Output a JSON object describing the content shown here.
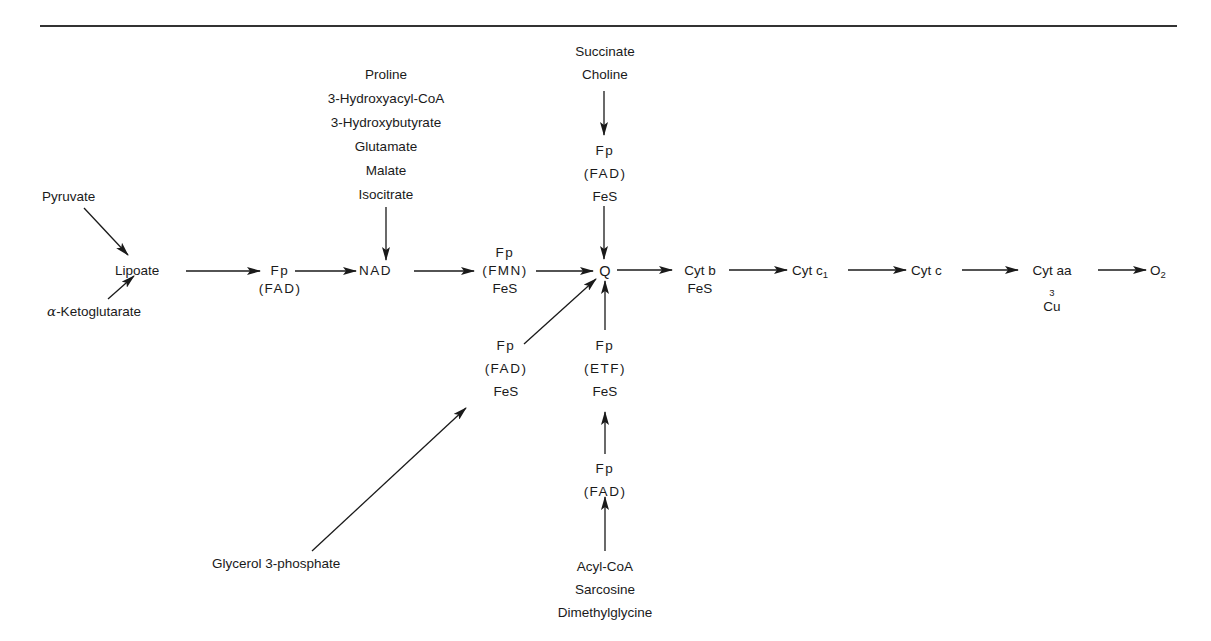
{
  "diagram": {
    "type": "electron-transport-chain",
    "colors": {
      "ink": "#1a1a1a",
      "background": "#ffffff",
      "rule": "#333333"
    },
    "main_chain": [
      {
        "id": "lipoate",
        "lines": [
          "Lipoate"
        ]
      },
      {
        "id": "fp_fad_1",
        "lines": [
          "Fp",
          "(FAD)"
        ]
      },
      {
        "id": "nad",
        "lines": [
          "NAD"
        ]
      },
      {
        "id": "fp_fmn",
        "lines": [
          "Fp",
          "(FMN)",
          "FeS"
        ]
      },
      {
        "id": "q",
        "lines": [
          "Q"
        ]
      },
      {
        "id": "cyt_b",
        "lines": [
          "Cyt b",
          "FeS"
        ]
      },
      {
        "id": "cyt_c1",
        "label": "Cyt c",
        "sub": "1"
      },
      {
        "id": "cyt_c",
        "lines": [
          "Cyt c"
        ]
      },
      {
        "id": "cyt_aa3",
        "label": "Cyt aa",
        "sub": "3",
        "second": "Cu"
      },
      {
        "id": "o2",
        "label": "O",
        "sub": "2"
      }
    ],
    "lipoate_inputs": {
      "top": "Pyruvate",
      "bottom_greek": "α",
      "bottom": "-Ketoglutarate"
    },
    "nad_substrates": [
      "Proline",
      "3-Hydroxyacyl-CoA",
      "3-Hydroxybutyrate",
      "Glutamate",
      "Malate",
      "Isocitrate"
    ],
    "succinate_branch": {
      "substrates": [
        "Succinate",
        "Choline"
      ],
      "carrier": [
        "Fp",
        "(FAD)",
        "FeS"
      ]
    },
    "glycerol_branch": {
      "substrate": "Glycerol 3-phosphate",
      "carrier": [
        "Fp",
        "(FAD)",
        "FeS"
      ]
    },
    "etf_branch": {
      "carrier_etf": [
        "Fp",
        "(ETF)",
        "FeS"
      ],
      "carrier_fad": [
        "Fp",
        "(FAD)"
      ],
      "substrates": [
        "Acyl-CoA",
        "Sarcosine",
        "Dimethylglycine"
      ]
    }
  }
}
